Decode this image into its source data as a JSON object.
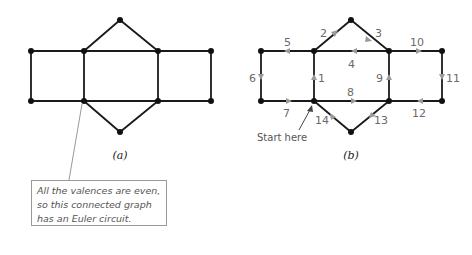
{
  "figure_a": {
    "caption": "(a)",
    "vertices": [
      [
        31,
        51
      ],
      [
        84,
        51
      ],
      [
        120,
        20
      ],
      [
        158,
        51
      ],
      [
        211,
        51
      ],
      [
        31,
        101
      ],
      [
        84,
        101
      ],
      [
        120,
        132
      ],
      [
        158,
        101
      ],
      [
        211,
        101
      ]
    ],
    "edges": [
      [
        0,
        1
      ],
      [
        1,
        3
      ],
      [
        3,
        4
      ],
      [
        5,
        6
      ],
      [
        6,
        8
      ],
      [
        8,
        9
      ],
      [
        0,
        5
      ],
      [
        1,
        6
      ],
      [
        3,
        8
      ],
      [
        4,
        9
      ],
      [
        1,
        2
      ],
      [
        2,
        3
      ],
      [
        6,
        7
      ],
      [
        7,
        8
      ]
    ]
  },
  "figure_b": {
    "caption": "(b)",
    "start_label": "Start here",
    "edge_labels": [
      "1",
      "2",
      "3",
      "4",
      "5",
      "6",
      "7",
      "8",
      "9",
      "10",
      "11",
      "12",
      "13",
      "14"
    ]
  },
  "callout": {
    "lines": [
      "All the valences are even,",
      "so this connected graph",
      "has an Euler circuit."
    ]
  },
  "colors": {
    "edge": "#1a1a1a",
    "arrow": "#9a9a9a",
    "label": "#6a6a6a"
  }
}
